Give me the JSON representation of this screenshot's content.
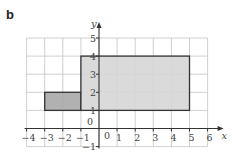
{
  "label": "b",
  "axes": {
    "x_name": "x",
    "y_name": "y",
    "x_min": -4,
    "x_max": 6,
    "y_min": -1,
    "y_max": 5,
    "x_ticks": [
      "−4",
      "−3",
      "−2",
      "−1",
      "0",
      "1",
      "2",
      "3",
      "4",
      "5",
      "6"
    ],
    "y_ticks": [
      "−1",
      "0",
      "1",
      "2",
      "3",
      "4",
      "5"
    ]
  },
  "shapes": [
    {
      "name": "small-rectangle",
      "x1": -3,
      "y1": 1,
      "x2": -1,
      "y2": 2,
      "fill": "#a9a9a9",
      "stroke": "#333333"
    },
    {
      "name": "large-rectangle",
      "x1": -1,
      "y1": 1,
      "x2": 5,
      "y2": 4,
      "fill": "#d6d6d6",
      "stroke": "#333333"
    }
  ],
  "colors": {
    "grid": "#c4c4c4",
    "axis": "#333333",
    "background": "#ffffff"
  }
}
